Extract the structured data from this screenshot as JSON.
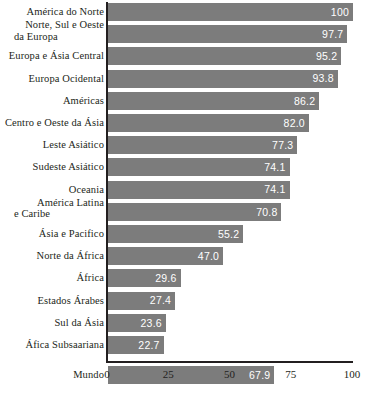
{
  "chart_data": {
    "type": "bar",
    "orientation": "horizontal",
    "title": "",
    "subtitle": "",
    "xlabel": "",
    "ylabel": "",
    "xlim": [
      0,
      100
    ],
    "xticks": [
      0,
      25,
      50,
      75,
      100
    ],
    "xtick_labels": [
      "0",
      "25",
      "50",
      "75",
      "100"
    ],
    "grid": false,
    "legend": null,
    "bar_color": "#7c7c7c",
    "value_label_color": "#ffffff",
    "axis_color": "#231f20",
    "categories": [
      "América do Norte",
      "Norte, Sul e Oeste da Europa",
      "Europa e Ásia Central",
      "Europa Ocidental",
      "Américas",
      "Centro e Oeste da Ásia",
      "Leste Asiático",
      "Sudeste Asiático",
      "Oceania",
      "América Latina e Caribe",
      "Ásia e Pacifico",
      "Norte da África",
      "África",
      "Estados Árabes",
      "Sul da Ásia",
      "Áfica Subsaariana",
      "Mundo"
    ],
    "values": [
      100,
      97.7,
      95.2,
      93.8,
      86.2,
      82.0,
      77.3,
      74.1,
      74.1,
      70.8,
      55.2,
      47.0,
      29.6,
      27.4,
      23.6,
      22.7,
      67.9
    ],
    "value_labels": [
      "100",
      "97.7",
      "95.2",
      "93.8",
      "86.2",
      "82.0",
      "77.3",
      "74.1",
      "74.1",
      "70.8",
      "55.2",
      "47.0",
      "29.6",
      "27.4",
      "23.6",
      "22.7",
      "67.9"
    ]
  },
  "rows": [
    {
      "label_line1": "América do Norte",
      "label_line2": "",
      "value_label": "100"
    },
    {
      "label_line1": "Norte, Sul e Oeste",
      "label_line2": "da Europa",
      "value_label": "97.7"
    },
    {
      "label_line1": "Europa e Ásia Central",
      "label_line2": "",
      "value_label": "95.2"
    },
    {
      "label_line1": "Europa Ocidental",
      "label_line2": "",
      "value_label": "93.8"
    },
    {
      "label_line1": "Américas",
      "label_line2": "",
      "value_label": "86.2"
    },
    {
      "label_line1": "Centro e Oeste da Ásia",
      "label_line2": "",
      "value_label": "82.0"
    },
    {
      "label_line1": "Leste Asiático",
      "label_line2": "",
      "value_label": "77.3"
    },
    {
      "label_line1": "Sudeste Asiático",
      "label_line2": "",
      "value_label": "74.1"
    },
    {
      "label_line1": "Oceania",
      "label_line2": "",
      "value_label": "74.1"
    },
    {
      "label_line1": "América Latina",
      "label_line2": "e Caribe",
      "value_label": "70.8"
    },
    {
      "label_line1": "Ásia e Pacifico",
      "label_line2": "",
      "value_label": "55.2"
    },
    {
      "label_line1": "Norte da África",
      "label_line2": "",
      "value_label": "47.0"
    },
    {
      "label_line1": "África",
      "label_line2": "",
      "value_label": "29.6"
    },
    {
      "label_line1": "Estados Árabes",
      "label_line2": "",
      "value_label": "27.4"
    },
    {
      "label_line1": "Sul da Ásia",
      "label_line2": "",
      "value_label": "23.6"
    },
    {
      "label_line1": "Áfica Subsaariana",
      "label_line2": "",
      "value_label": "22.7"
    },
    {
      "label_line1": "Mundo",
      "label_line2": "",
      "value_label": "67.9"
    }
  ],
  "axis": {
    "ticks": [
      {
        "label": "0"
      },
      {
        "label": "25"
      },
      {
        "label": "50"
      },
      {
        "label": "75"
      },
      {
        "label": "100"
      }
    ]
  }
}
